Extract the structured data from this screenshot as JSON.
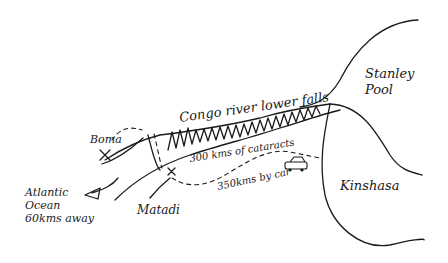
{
  "map": {
    "style": "hand-drawn sketch",
    "ink_color": "#1a1a1a",
    "background": "#ffffff",
    "labels": {
      "stanley_pool_1": "Stanley",
      "stanley_pool_2": "Pool",
      "river": "Congo river lower falls",
      "cataracts": "300 kms of cataracts",
      "boma": "Boma",
      "atlantic_1": "Atlantic",
      "atlantic_2": "Ocean",
      "atlantic_3": "60kms away",
      "matadi": "Matadi",
      "car_route": "350kms by car",
      "kinshasa": "Kinshasa"
    },
    "places": [
      {
        "name": "Stanley Pool",
        "type": "lake"
      },
      {
        "name": "Kinshasa",
        "type": "city"
      },
      {
        "name": "Matadi",
        "type": "town",
        "marker": "x"
      },
      {
        "name": "Boma",
        "type": "town",
        "marker": "x"
      },
      {
        "name": "Atlantic Ocean",
        "type": "ocean",
        "note": "60kms away"
      }
    ],
    "routes": [
      {
        "name": "Congo river lower falls",
        "length": "300 kms of cataracts"
      },
      {
        "name": "car route",
        "length": "350kms by car",
        "icon": "car-icon"
      }
    ]
  }
}
